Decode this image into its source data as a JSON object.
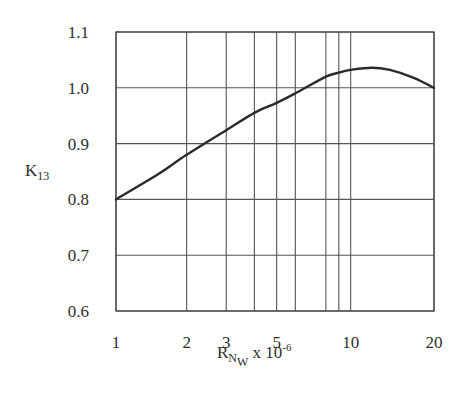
{
  "chart_data": {
    "type": "line",
    "title": "",
    "xlabel": "R_Nw x 10^-6",
    "xlabel_parts": {
      "main": "R",
      "sub": "N",
      "subsub": "W",
      "rest": " x 10",
      "sup": "-6"
    },
    "ylabel": "K13",
    "ylabel_parts": {
      "main": "K",
      "sub": "13"
    },
    "x_scale": "log",
    "xlim": [
      1,
      20
    ],
    "ylim": [
      0.6,
      1.1
    ],
    "grid": true,
    "x_gridlines": [
      1,
      2,
      3,
      4,
      5,
      6,
      8,
      9,
      10,
      20
    ],
    "x_tick_labels": [
      "1",
      "2",
      "3",
      "5",
      "10",
      "20"
    ],
    "x_tick_values": [
      1,
      2,
      3,
      5,
      10,
      20
    ],
    "y_tick_labels": [
      "1.1",
      "1.0",
      "0.9",
      "0.8",
      "0.7",
      "0.6"
    ],
    "y_tick_values": [
      1.1,
      1.0,
      0.9,
      0.8,
      0.7,
      0.6
    ],
    "legend": null,
    "series": [
      {
        "name": "K13",
        "x": [
          1,
          1.5,
          2,
          3,
          4,
          5,
          6,
          8,
          9,
          10,
          12,
          14,
          17,
          20
        ],
        "y": [
          0.8,
          0.845,
          0.88,
          0.924,
          0.955,
          0.973,
          0.99,
          1.02,
          1.027,
          1.032,
          1.036,
          1.032,
          1.018,
          1.0
        ]
      }
    ]
  }
}
